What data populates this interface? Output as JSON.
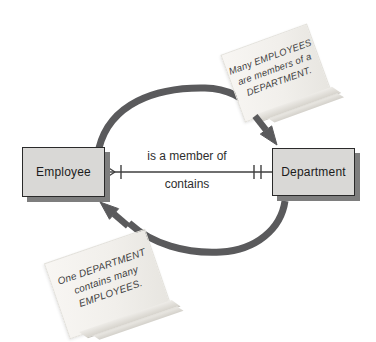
{
  "diagram": {
    "entities": [
      {
        "label": "Employee",
        "cardinality_icon": "crow-foot-many-with-one-bar"
      },
      {
        "label": "Department",
        "cardinality_icon": "one-and-only-one-double-bar"
      }
    ],
    "relationship": {
      "label_top": "is a member of",
      "label_bottom": "contains"
    },
    "notes": [
      {
        "lines": [
          "Many EMPLOYEES",
          "are members of a",
          "DEPARTMENT."
        ]
      },
      {
        "lines": [
          "One DEPARTMENT",
          "contains many",
          "EMPLOYEES."
        ]
      }
    ],
    "colors": {
      "entity_fill": "#d9d8d6",
      "entity_border": "#2a2a2a",
      "entity_shadow": "#7e7e7e",
      "arc_arrow": "#5a5a5c",
      "relationship_line": "#3f3f3f",
      "note_fill": "#f1efeb",
      "note_fold": "#d6d3cc",
      "note_text": "#3f3f3f",
      "canvas_bg": "#ffffff"
    }
  }
}
